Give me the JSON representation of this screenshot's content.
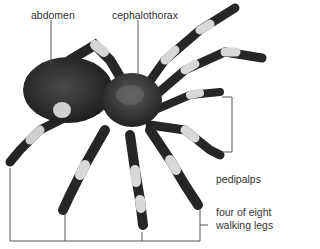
{
  "diagram": {
    "labels": {
      "abdomen": "abdomen",
      "cephalothorax": "cephalothorax",
      "pedipalps": "pedipalps",
      "legs_line1": "four of eight",
      "legs_line2": "walking legs"
    }
  },
  "colors": {
    "body": "#2a2a2a",
    "leg_band": "#d8d8d8",
    "line": "#555555",
    "text": "#333333"
  }
}
